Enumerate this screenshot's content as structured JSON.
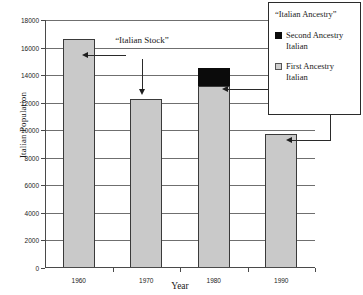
{
  "chart_data": {
    "type": "bar",
    "title": "",
    "xlabel": "Year",
    "ylabel": "Italian Population",
    "categories": [
      "1960",
      "1970",
      "1980",
      "1990"
    ],
    "series": [
      {
        "name": "First Ancestry Italian",
        "color": "#c9c9c9",
        "values": [
          16600,
          12300,
          13200,
          9700
        ]
      },
      {
        "name": "Second Ancestry Italian",
        "color": "#0b0b0b",
        "values": [
          0,
          0,
          1300,
          0
        ]
      }
    ],
    "totals": [
      16600,
      12300,
      14500,
      9700
    ],
    "ylim": [
      0,
      18000
    ],
    "ytick_step": 2000,
    "yticks": [
      "0",
      "2000",
      "4000",
      "6000",
      "8000",
      "10000",
      "12000",
      "14000",
      "16000",
      "18000"
    ],
    "grid": "horizontal",
    "legend_position": "top-right",
    "stacked": true
  },
  "legend": {
    "title": "“Italian Ancestry”",
    "entries": [
      {
        "label": "Second Ancestry Italian",
        "swatch": "black-swatch"
      },
      {
        "label": "First Ancestry Italian",
        "swatch": "gray-swatch"
      }
    ]
  },
  "annotations": {
    "italian_stock": "“Italian Stock”"
  },
  "axes": {
    "y_title": "Italian Population",
    "x_title": "Year"
  }
}
